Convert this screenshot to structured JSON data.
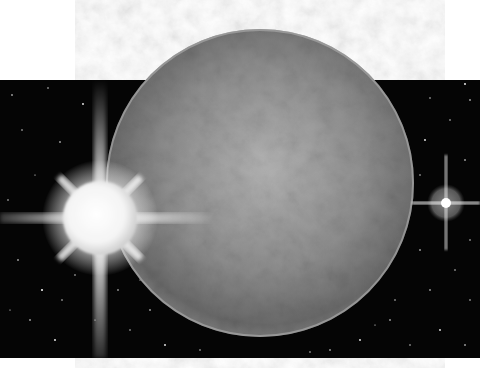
{
  "scene": {
    "description": "Illustration of a grey cratered planet against a black starfield with a bright star to the left and a small distant star to the right",
    "colors": {
      "background": "#ffffff",
      "space": "#050505",
      "planet_light": "#a8a8a8",
      "planet_dark": "#5a5a5a",
      "star_core": "#ffffff"
    },
    "planet": {
      "cx": 260,
      "cy": 183,
      "r": 154
    },
    "big_star": {
      "cx": 100,
      "cy": 218,
      "r": 37
    },
    "small_star": {
      "cx": 446,
      "cy": 203,
      "r": 5,
      "halo_r": 19
    }
  }
}
